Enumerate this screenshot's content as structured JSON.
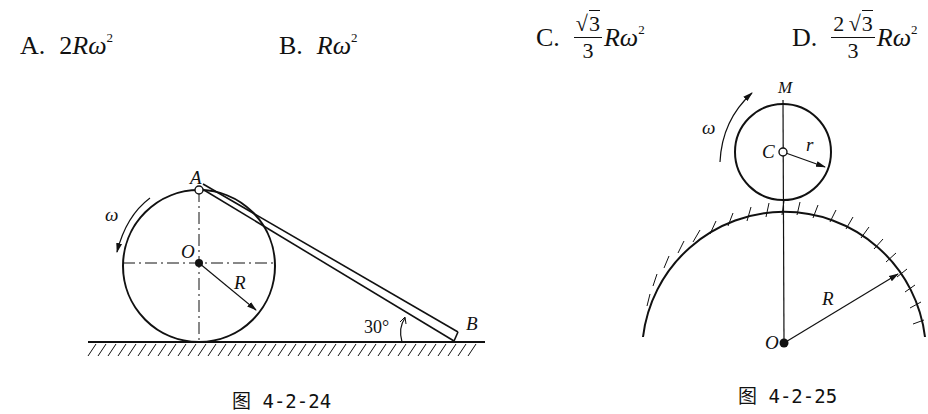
{
  "options": [
    {
      "label": "A.",
      "coef": "2",
      "expr": "Rω",
      "exp": "2"
    },
    {
      "label": "B.",
      "coef": "",
      "expr": "Rω",
      "exp": "2"
    },
    {
      "label": "C.",
      "num_coef": "",
      "num_root": "3",
      "den": "3",
      "expr": "Rω",
      "exp": "2"
    },
    {
      "label": "D.",
      "num_coef": "2",
      "num_root": "3",
      "den": "3",
      "expr": "Rω",
      "exp": "2"
    }
  ],
  "figure_left": {
    "labels": {
      "A": "A",
      "O": "O",
      "R": "R",
      "omega": "ω",
      "angle": "30°",
      "B": "B"
    },
    "caption": "图 4-2-24"
  },
  "figure_right": {
    "labels": {
      "M": "M",
      "C": "C",
      "r": "r",
      "omega": "ω",
      "R": "R",
      "O": "O"
    },
    "caption": "图 4-2-25"
  }
}
